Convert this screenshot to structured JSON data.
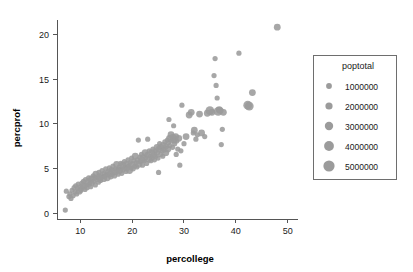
{
  "chart_data": {
    "type": "scatter",
    "title": "",
    "xlabel": "percollege",
    "ylabel": "percprof",
    "xlim": [
      5.5,
      52
    ],
    "ylim": [
      -0.6,
      21.6
    ],
    "xticks": [
      10,
      20,
      30,
      40,
      50
    ],
    "yticks": [
      0,
      5,
      10,
      15,
      20
    ],
    "grid": false,
    "point_color": "#9b9b9b",
    "size_encoding": "poptotal",
    "legend": {
      "title": "poptotal",
      "position": "right",
      "entries": [
        {
          "label": "1000000",
          "value": 1000000,
          "radius": 2.9
        },
        {
          "label": "2000000",
          "value": 2000000,
          "radius": 3.6
        },
        {
          "label": "3000000",
          "value": 3000000,
          "radius": 4.2
        },
        {
          "label": "4000000",
          "value": 4000000,
          "radius": 4.9
        },
        {
          "label": "5000000",
          "value": 5000000,
          "radius": 5.6
        }
      ]
    },
    "points": [
      [
        7.1,
        0.4,
        1
      ],
      [
        7.3,
        2.5,
        1
      ],
      [
        7.8,
        1.9,
        1
      ],
      [
        8.0,
        2.2,
        1
      ],
      [
        8.2,
        1.7,
        1
      ],
      [
        8.4,
        2.6,
        1
      ],
      [
        8.6,
        2.0,
        1
      ],
      [
        8.8,
        2.9,
        1
      ],
      [
        9.0,
        2.4,
        1
      ],
      [
        9.1,
        3.1,
        1
      ],
      [
        9.3,
        2.2,
        1
      ],
      [
        9.5,
        2.8,
        1
      ],
      [
        9.6,
        3.3,
        1
      ],
      [
        9.8,
        2.5,
        2
      ],
      [
        10.0,
        3.0,
        1
      ],
      [
        10.1,
        2.6,
        1
      ],
      [
        10.3,
        3.4,
        1
      ],
      [
        10.4,
        2.9,
        1
      ],
      [
        10.6,
        3.6,
        1
      ],
      [
        10.7,
        3.1,
        2
      ],
      [
        10.9,
        2.7,
        1
      ],
      [
        11.0,
        3.8,
        1
      ],
      [
        11.2,
        3.2,
        1
      ],
      [
        11.3,
        2.9,
        1
      ],
      [
        11.5,
        3.5,
        2
      ],
      [
        11.6,
        4.0,
        1
      ],
      [
        11.8,
        3.3,
        1
      ],
      [
        11.9,
        3.7,
        1
      ],
      [
        12.0,
        3.0,
        1
      ],
      [
        12.2,
        3.9,
        2
      ],
      [
        12.3,
        3.4,
        1
      ],
      [
        12.5,
        4.2,
        1
      ],
      [
        12.6,
        3.6,
        1
      ],
      [
        12.8,
        4.0,
        1
      ],
      [
        12.9,
        3.2,
        1
      ],
      [
        13.0,
        4.4,
        2
      ],
      [
        13.2,
        3.8,
        1
      ],
      [
        13.3,
        4.1,
        1
      ],
      [
        13.5,
        3.5,
        1
      ],
      [
        13.6,
        4.6,
        1
      ],
      [
        13.8,
        4.0,
        2
      ],
      [
        13.9,
        3.7,
        1
      ],
      [
        14.0,
        4.3,
        1
      ],
      [
        14.2,
        4.8,
        1
      ],
      [
        14.3,
        4.1,
        1
      ],
      [
        14.5,
        3.9,
        2
      ],
      [
        14.6,
        4.5,
        1
      ],
      [
        14.8,
        4.2,
        1
      ],
      [
        14.9,
        5.0,
        1
      ],
      [
        15.0,
        4.4,
        1
      ],
      [
        15.2,
        4.0,
        2
      ],
      [
        15.3,
        4.7,
        1
      ],
      [
        15.5,
        4.3,
        1
      ],
      [
        15.6,
        5.1,
        1
      ],
      [
        15.8,
        4.5,
        2
      ],
      [
        15.9,
        4.1,
        1
      ],
      [
        16.0,
        4.9,
        1
      ],
      [
        16.2,
        4.4,
        1
      ],
      [
        16.3,
        5.3,
        1
      ],
      [
        16.5,
        4.7,
        2
      ],
      [
        16.6,
        4.2,
        1
      ],
      [
        16.8,
        5.0,
        1
      ],
      [
        16.9,
        4.6,
        1
      ],
      [
        17.0,
        5.5,
        2
      ],
      [
        17.2,
        4.9,
        1
      ],
      [
        17.3,
        4.4,
        1
      ],
      [
        17.5,
        5.2,
        1
      ],
      [
        17.6,
        4.8,
        2
      ],
      [
        17.8,
        5.6,
        1
      ],
      [
        17.9,
        5.0,
        1
      ],
      [
        18.0,
        4.5,
        1
      ],
      [
        18.2,
        5.4,
        2
      ],
      [
        18.3,
        4.9,
        1
      ],
      [
        18.5,
        5.8,
        1
      ],
      [
        18.6,
        5.2,
        1
      ],
      [
        18.8,
        4.7,
        1
      ],
      [
        18.9,
        5.5,
        2
      ],
      [
        19.0,
        5.0,
        1
      ],
      [
        19.2,
        6.0,
        1
      ],
      [
        19.3,
        5.3,
        1
      ],
      [
        19.5,
        4.8,
        2
      ],
      [
        19.6,
        5.7,
        1
      ],
      [
        19.8,
        5.1,
        1
      ],
      [
        19.9,
        6.2,
        1
      ],
      [
        20.0,
        5.5,
        2
      ],
      [
        20.2,
        5.0,
        1
      ],
      [
        20.3,
        5.9,
        1
      ],
      [
        20.5,
        5.3,
        1
      ],
      [
        20.6,
        6.4,
        2
      ],
      [
        20.8,
        5.7,
        1
      ],
      [
        20.9,
        5.2,
        1
      ],
      [
        21.0,
        6.0,
        1
      ],
      [
        21.2,
        8.2,
        1
      ],
      [
        21.3,
        5.5,
        2
      ],
      [
        21.5,
        6.3,
        1
      ],
      [
        21.6,
        5.8,
        1
      ],
      [
        21.8,
        6.6,
        1
      ],
      [
        21.9,
        6.0,
        2
      ],
      [
        22.0,
        5.4,
        1
      ],
      [
        22.2,
        6.4,
        1
      ],
      [
        22.3,
        5.9,
        1
      ],
      [
        22.5,
        6.8,
        2
      ],
      [
        22.6,
        6.2,
        1
      ],
      [
        22.8,
        5.6,
        1
      ],
      [
        22.9,
        6.6,
        1
      ],
      [
        23.0,
        8.3,
        1
      ],
      [
        23.2,
        6.1,
        2
      ],
      [
        23.3,
        7.0,
        1
      ],
      [
        23.5,
        6.4,
        1
      ],
      [
        23.6,
        5.9,
        1
      ],
      [
        23.8,
        6.8,
        2
      ],
      [
        23.9,
        6.2,
        1
      ],
      [
        24.0,
        7.2,
        1
      ],
      [
        24.2,
        6.6,
        2
      ],
      [
        24.3,
        6.0,
        1
      ],
      [
        24.5,
        7.0,
        1
      ],
      [
        24.6,
        6.4,
        1
      ],
      [
        24.8,
        7.4,
        2
      ],
      [
        24.9,
        6.8,
        1
      ],
      [
        25.0,
        6.2,
        1
      ],
      [
        25.1,
        4.6,
        1
      ],
      [
        25.2,
        7.2,
        2
      ],
      [
        25.3,
        7.8,
        1
      ],
      [
        25.5,
        6.6,
        1
      ],
      [
        25.6,
        7.4,
        2
      ],
      [
        25.8,
        7.0,
        1
      ],
      [
        25.9,
        6.4,
        1
      ],
      [
        26.0,
        7.6,
        2
      ],
      [
        26.2,
        7.1,
        1
      ],
      [
        26.3,
        8.0,
        1
      ],
      [
        26.5,
        6.8,
        2
      ],
      [
        26.6,
        7.5,
        1
      ],
      [
        26.8,
        8.2,
        1
      ],
      [
        26.9,
        7.2,
        2
      ],
      [
        27.0,
        7.9,
        1
      ],
      [
        27.1,
        10.5,
        1
      ],
      [
        27.2,
        8.4,
        2
      ],
      [
        27.3,
        7.6,
        1
      ],
      [
        27.5,
        8.8,
        2
      ],
      [
        27.6,
        8.1,
        1
      ],
      [
        27.8,
        7.4,
        1
      ],
      [
        27.9,
        8.5,
        2
      ],
      [
        28.0,
        9.8,
        1
      ],
      [
        28.1,
        8.2,
        2
      ],
      [
        28.2,
        7.8,
        1
      ],
      [
        28.4,
        8.6,
        2
      ],
      [
        28.5,
        6.6,
        1
      ],
      [
        28.6,
        8.1,
        1
      ],
      [
        28.8,
        7.2,
        1
      ],
      [
        29.0,
        8.4,
        2
      ],
      [
        29.2,
        5.4,
        1
      ],
      [
        29.4,
        7.0,
        1
      ],
      [
        29.6,
        12.1,
        1
      ],
      [
        30.0,
        7.8,
        1
      ],
      [
        30.4,
        8.6,
        2
      ],
      [
        31.0,
        11.0,
        2
      ],
      [
        31.4,
        11.3,
        2
      ],
      [
        31.8,
        9.0,
        1
      ],
      [
        32.0,
        9.3,
        2
      ],
      [
        32.3,
        8.3,
        1
      ],
      [
        32.6,
        8.8,
        1
      ],
      [
        33.0,
        11.1,
        2
      ],
      [
        33.4,
        9.0,
        2
      ],
      [
        34.0,
        8.6,
        1
      ],
      [
        34.5,
        11.2,
        2
      ],
      [
        35.0,
        11.5,
        3
      ],
      [
        35.4,
        11.3,
        2
      ],
      [
        35.8,
        15.4,
        1
      ],
      [
        36.0,
        17.3,
        1
      ],
      [
        36.2,
        14.3,
        1
      ],
      [
        36.4,
        12.9,
        1
      ],
      [
        36.6,
        11.4,
        3
      ],
      [
        36.8,
        11.6,
        2
      ],
      [
        37.0,
        11.5,
        2
      ],
      [
        37.2,
        7.7,
        1
      ],
      [
        37.4,
        9.4,
        1
      ],
      [
        37.6,
        11.3,
        2
      ],
      [
        40.6,
        17.9,
        1
      ],
      [
        42.3,
        12.1,
        3
      ],
      [
        42.6,
        12.0,
        3
      ],
      [
        43.2,
        13.5,
        2
      ],
      [
        48.0,
        20.8,
        2
      ]
    ]
  }
}
